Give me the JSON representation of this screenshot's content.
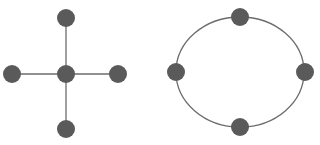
{
  "diagrams": [
    {
      "name": "star-topology",
      "edge_color": "#6b6b6b",
      "node_color": "#5a5a5a",
      "node_radius": 9,
      "nodes": [
        {
          "id": "center",
          "x": 66,
          "y": 74
        },
        {
          "id": "top",
          "x": 66,
          "y": 18
        },
        {
          "id": "left",
          "x": 12,
          "y": 74
        },
        {
          "id": "right",
          "x": 118,
          "y": 74
        },
        {
          "id": "bottom",
          "x": 66,
          "y": 129
        }
      ],
      "edges": [
        [
          "center",
          "top"
        ],
        [
          "center",
          "left"
        ],
        [
          "center",
          "right"
        ],
        [
          "center",
          "bottom"
        ]
      ]
    },
    {
      "name": "ring-topology",
      "edge_color": "#6b6b6b",
      "node_color": "#5a5a5a",
      "node_radius": 9,
      "ellipse": {
        "cx": 240,
        "cy": 72,
        "rx": 64,
        "ry": 55
      },
      "nodes": [
        {
          "id": "top",
          "x": 240,
          "y": 17
        },
        {
          "id": "left",
          "x": 176,
          "y": 72
        },
        {
          "id": "right",
          "x": 305,
          "y": 72
        },
        {
          "id": "bottom",
          "x": 240,
          "y": 127
        }
      ]
    }
  ]
}
